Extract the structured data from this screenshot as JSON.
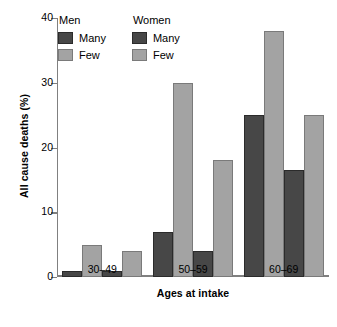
{
  "chart_data": {
    "type": "bar",
    "title": "",
    "xlabel": "Ages at intake",
    "ylabel": "All cause deaths (%)",
    "categories": [
      "30–49",
      "50–59",
      "60–69"
    ],
    "ylim": [
      0,
      40
    ],
    "yticks": [
      0,
      10,
      20,
      30,
      40
    ],
    "ytick_labels": [
      "0",
      "10",
      "20",
      "30",
      "40"
    ],
    "grid": false,
    "legend_position": "upper-left-inside",
    "series": [
      {
        "name": "Men Many",
        "group": "Men",
        "level": "Many",
        "color": "#474747",
        "values": [
          1,
          7,
          25
        ]
      },
      {
        "name": "Men Few",
        "group": "Men",
        "level": "Few",
        "color": "#a3a3a3",
        "values": [
          5,
          30,
          38
        ]
      },
      {
        "name": "Women Many",
        "group": "Women",
        "level": "Many",
        "color": "#474747",
        "values": [
          1,
          4,
          16.5
        ]
      },
      {
        "name": "Women Few",
        "group": "Women",
        "level": "Few",
        "color": "#a3a3a3",
        "values": [
          4,
          18,
          25
        ]
      }
    ]
  },
  "legend": {
    "blocks": [
      {
        "title": "Men",
        "entries": [
          {
            "label": "Many",
            "swatch": "dark"
          },
          {
            "label": "Few",
            "swatch": "light"
          }
        ]
      },
      {
        "title": "Women",
        "entries": [
          {
            "label": "Many",
            "swatch": "dark"
          },
          {
            "label": "Few",
            "swatch": "light"
          }
        ]
      }
    ]
  },
  "axes": {
    "y_title": "All cause deaths (%)",
    "x_title": "Ages at intake"
  }
}
